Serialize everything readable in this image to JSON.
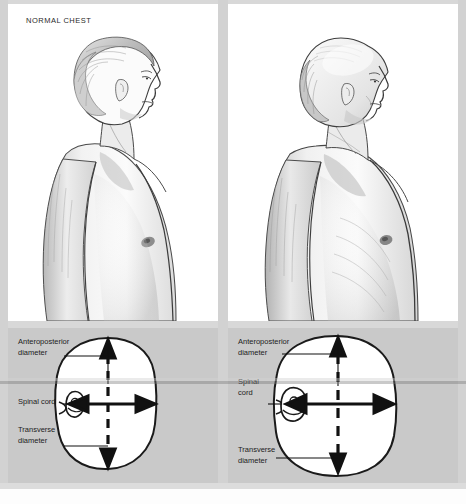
{
  "figure": {
    "type": "medical-illustration",
    "background_color": "#d8d8d8",
    "panel_color": "#ffffff",
    "diagram_panel_color": "#c9c9c9"
  },
  "panels": {
    "left": {
      "caption": "NORMAL CHEST",
      "illustration": "man-profile-normal-chest",
      "cross_section": {
        "shape": "oval-narrow-anteroposterior",
        "labels": {
          "anteroposterior": [
            "Anteroposterior",
            "diameter"
          ],
          "spinal_cord": [
            "Spinal cord"
          ],
          "transverse": [
            "Transverse",
            "diameter"
          ]
        }
      }
    },
    "right": {
      "caption": "BARREL CHEST",
      "illustration": "man-profile-barrel-chest",
      "cross_section": {
        "shape": "round-increased-anteroposterior",
        "labels": {
          "anteroposterior": [
            "Anteroposterior",
            "diameter"
          ],
          "spinal_cord": [
            "Spinal",
            "cord"
          ],
          "transverse": [
            "Transverse",
            "diameter"
          ]
        }
      }
    }
  },
  "arrows": {
    "vertical_style": "dashed-double-headed",
    "horizontal_style": "solid-double-headed"
  }
}
